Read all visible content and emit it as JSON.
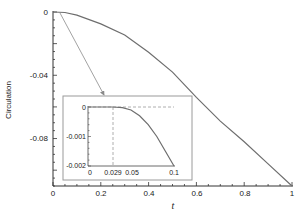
{
  "chart_data": [
    {
      "type": "line",
      "title": "",
      "xlabel": "t",
      "ylabel": "Circulation",
      "xlim": [
        0,
        1
      ],
      "ylim": [
        -0.11,
        0
      ],
      "xticks": [
        "0",
        "0.2",
        "0.4",
        "0.6",
        "0.8",
        "1"
      ],
      "yticks": [
        "0",
        "-0.04",
        "-0.08"
      ],
      "grid": false,
      "legend": null,
      "series": [
        {
          "name": "Circulation",
          "x": [
            0,
            0.05,
            0.1,
            0.2,
            0.3,
            0.4,
            0.5,
            0.6,
            0.7,
            0.8,
            0.9,
            1.0
          ],
          "values": [
            0,
            -0.0003,
            -0.002,
            -0.0075,
            -0.0145,
            -0.0255,
            -0.038,
            -0.054,
            -0.069,
            -0.082,
            -0.096,
            -0.11
          ]
        }
      ],
      "annotations": [
        "arrow from origin region pointing to inset (zoom of 0 ≤ t ≤ 0.1)"
      ]
    },
    {
      "type": "line",
      "title": "inset",
      "xlabel": "",
      "ylabel": "",
      "xlim": [
        0,
        0.1
      ],
      "ylim": [
        -0.002,
        0
      ],
      "xticks": [
        "0",
        "0.029",
        "0.05",
        "0.1"
      ],
      "yticks": [
        "0",
        "-0.001",
        "-0.002"
      ],
      "grid": false,
      "series": [
        {
          "name": "Circulation (zoom)",
          "x": [
            0,
            0.01,
            0.02,
            0.029,
            0.04,
            0.05,
            0.06,
            0.07,
            0.08,
            0.09,
            0.1
          ],
          "values": [
            0,
            0,
            0,
            0,
            -2e-05,
            -0.0001,
            -0.0003,
            -0.0006,
            -0.001,
            -0.0015,
            -0.002
          ]
        }
      ],
      "annotations": [
        "dashed horizontal reference line at 0",
        "dashed vertical line at t = 0.029"
      ]
    }
  ],
  "main": {
    "ylabel": "Circulation",
    "xlabel": "t",
    "xticks": [
      "0",
      "0.2",
      "0.4",
      "0.6",
      "0.8",
      "1"
    ],
    "yticks": [
      "0",
      "-0.04",
      "-0.08"
    ]
  },
  "inset": {
    "xticks": [
      "0",
      "0.029",
      "0.05",
      "0.1"
    ],
    "yticks": [
      "0",
      "-0.001",
      "-0.002"
    ]
  },
  "colors": {
    "curve": "#6e6e6e",
    "axis": "#333333",
    "frame": "#9a9a9a",
    "dashed": "#9a9a9a"
  }
}
